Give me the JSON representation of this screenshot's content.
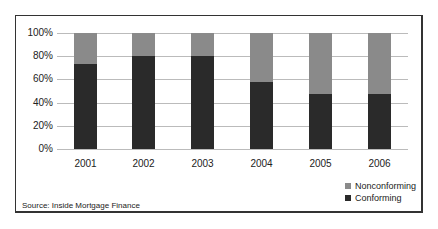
{
  "chart_data": {
    "type": "bar",
    "stacked": true,
    "categories": [
      "2001",
      "2002",
      "2003",
      "2004",
      "2005",
      "2006"
    ],
    "series": [
      {
        "name": "Conforming",
        "color": "#2a2a2a",
        "values": [
          73,
          80,
          80,
          58,
          47,
          47
        ]
      },
      {
        "name": "Nonconforming",
        "color": "#8a8a8a",
        "values": [
          27,
          20,
          20,
          42,
          53,
          53
        ]
      }
    ],
    "yticks": [
      "0%",
      "20%",
      "40%",
      "60%",
      "80%",
      "100%"
    ],
    "ylim": [
      0,
      100
    ],
    "grid": true,
    "legend_position": "bottom-right",
    "source": "Source: Inside Mortgage Finance"
  }
}
